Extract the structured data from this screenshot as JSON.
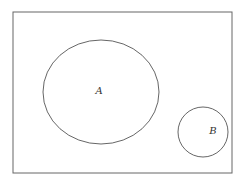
{
  "diagram": {
    "type": "venn",
    "universe": {
      "x": 13,
      "y": 12,
      "width": 219,
      "height": 161,
      "stroke": "#666666"
    },
    "sets": [
      {
        "label": "A",
        "shape": "ellipse",
        "cx": 101,
        "cy": 92,
        "rx": 58,
        "ry": 52,
        "label_x": 99,
        "label_y": 94
      },
      {
        "label": "B",
        "shape": "circle",
        "cx": 203,
        "cy": 132,
        "rx": 25,
        "ry": 25,
        "label_x": 213,
        "label_y": 134
      }
    ],
    "relationship": "disjoint",
    "stroke_color": "#555555"
  }
}
